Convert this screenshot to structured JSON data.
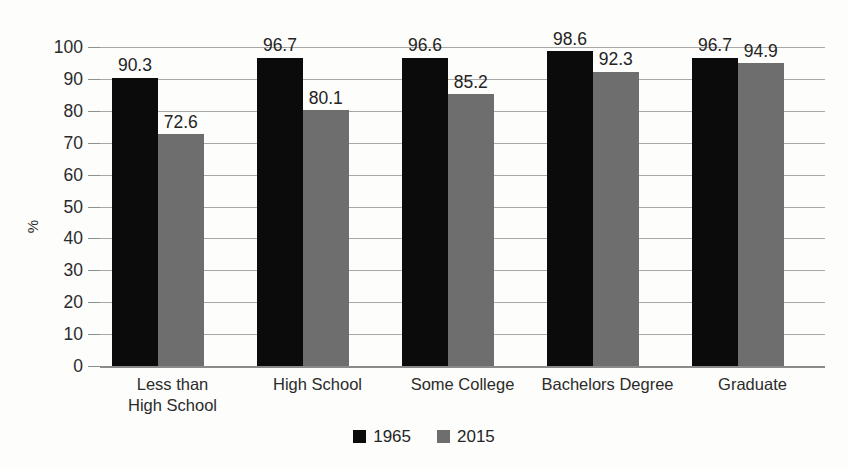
{
  "chart_data": {
    "type": "bar",
    "title": "",
    "xlabel": "",
    "ylabel": "%",
    "ylim": [
      0,
      100
    ],
    "ytick_step": 10,
    "yticks": [
      0,
      10,
      20,
      30,
      40,
      50,
      60,
      70,
      80,
      90,
      100
    ],
    "grid": true,
    "legend_position": "bottom-center",
    "categories": [
      "Less than\nHigh School",
      "High School",
      "Some College",
      "Bachelors Degree",
      "Graduate"
    ],
    "series": [
      {
        "name": "1965",
        "color": "#0b0b0b",
        "values": [
          90.3,
          96.7,
          96.6,
          98.6,
          96.7
        ],
        "labels": [
          "90.3",
          "96.7",
          "96.6",
          "98.6",
          "96.7"
        ]
      },
      {
        "name": "2015",
        "color": "#6e6e6e",
        "values": [
          72.6,
          80.1,
          85.2,
          92.3,
          94.9
        ],
        "labels": [
          "72.6",
          "80.1",
          "85.2",
          "92.3",
          "94.9"
        ]
      }
    ]
  },
  "colors": {
    "background": "#fdfdfc",
    "gridline": "#a8a8a8",
    "axis": "#8a8a8a",
    "text": "#2a2a2a",
    "series_1965": "#0b0b0b",
    "series_2015": "#6e6e6e"
  }
}
